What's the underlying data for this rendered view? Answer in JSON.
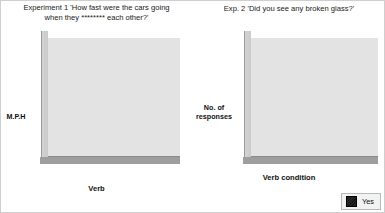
{
  "figure": {
    "panels": [
      {
        "id": "experiment-1",
        "title_line1": "Experiment 1 'How fast were the cars going",
        "title_line2": "when they ******** each other?'"
      },
      {
        "id": "experiment-2",
        "title_line1": "Exp. 2 'Did you see any broken glass?'",
        "title_line2": ""
      }
    ],
    "legend": {
      "label": "Yes",
      "color": "#1d1d1d"
    }
  },
  "chart_data": [
    {
      "type": "bar",
      "id": "experiment-1",
      "title": "Experiment 1 'How fast were the cars going when they ******** each other?'",
      "categories": [
        "Smashed",
        "Collided",
        "Bumped",
        "Hit",
        "Contacted"
      ],
      "values": [
        40.8,
        39.3,
        38.1,
        34,
        31.8
      ],
      "labels": [
        "40.8",
        "39.3",
        "38.1",
        "34",
        "31.8"
      ],
      "xlabel": "Verb",
      "ylabel": "M.P.H",
      "ylim": [
        0,
        45
      ],
      "yticks": [
        0,
        5,
        10,
        15,
        20,
        25,
        30,
        35,
        40,
        45
      ],
      "ytick_labels": [
        "0",
        "5",
        "10",
        "15",
        "20",
        "25",
        "30",
        "35",
        "40",
        "45"
      ],
      "grid": true,
      "legend": "none",
      "staggered_xticks": true,
      "bar_color": "#1d1d1d"
    },
    {
      "type": "bar",
      "id": "experiment-2",
      "title": "Exp. 2 'Did you see any broken glass?'",
      "categories": [
        "Smashed",
        "Hit",
        "Control"
      ],
      "series": [
        {
          "name": "Yes",
          "values": [
            16,
            7,
            6
          ],
          "labels": [
            "16",
            "7",
            "6"
          ]
        },
        {
          "name": "No",
          "values": [
            34,
            43,
            44
          ],
          "labels": [
            "34",
            "43",
            "44"
          ]
        }
      ],
      "xlabel": "Verb condition",
      "ylabel": "No. of responses",
      "ylabel_line1": "No. of",
      "ylabel_line2": "responses",
      "ylim": [
        0,
        45
      ],
      "yticks": [
        0,
        5,
        10,
        15,
        20,
        25,
        30,
        35,
        40,
        45
      ],
      "ytick_labels": [
        "0",
        "5",
        "10",
        "15",
        "20",
        "25",
        "30",
        "35",
        "40",
        "45"
      ],
      "grid": true,
      "legend": "bottom-right",
      "legend_entries": [
        "Yes"
      ],
      "bar_color": "#1d1d1d"
    }
  ]
}
